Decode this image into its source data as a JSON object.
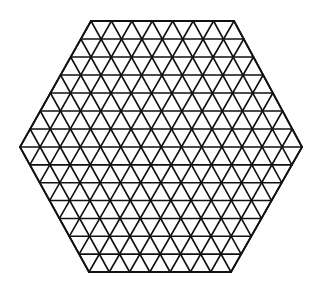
{
  "diagram": {
    "type": "triangular-lattice-hexagon",
    "shape": "regular hexagon",
    "triangles_per_edge": 7,
    "line_color": "#111111",
    "background_color": "#ffffff",
    "vertices": {
      "top_left": [
        91,
        21
      ],
      "top_right": [
        234,
        21
      ],
      "right": [
        302,
        147
      ],
      "bottom_right": [
        231,
        272
      ],
      "bottom_left": [
        89,
        272
      ],
      "left": [
        20,
        147
      ]
    }
  }
}
